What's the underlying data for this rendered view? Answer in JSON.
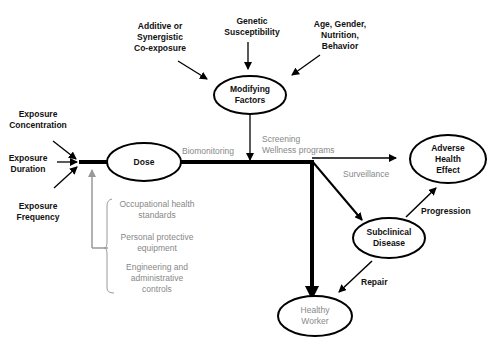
{
  "nodes": {
    "dose": "Dose",
    "modifying": "Modifying\nFactors",
    "adverse": "Adverse\nHealth\nEffect",
    "subclinical": "Subclinical\nDisease",
    "healthy": "Healthy\nWorker"
  },
  "inputs": {
    "concentration": "Exposure\nConcentration",
    "duration": "Exposure\nDuration",
    "frequency": "Exposure\nFrequency"
  },
  "modifiers": {
    "coexposure": "Additive or\nSynergistic\nCo-exposure",
    "genetic": "Genetic\nSusceptibility",
    "age": "Age, Gender,\nNutrition,\nBehavior"
  },
  "labels": {
    "biomonitoring": "Biomonitoring",
    "screening": "Screening\nWellness programs",
    "surveillance": "Surveillance",
    "progression": "Progression",
    "repair": "Repair"
  },
  "controls": {
    "occupational": "Occupational health\nstandards",
    "ppe": "Personal protective\nequipment",
    "engineering": "Engineering and\nadministrative\ncontrols"
  }
}
